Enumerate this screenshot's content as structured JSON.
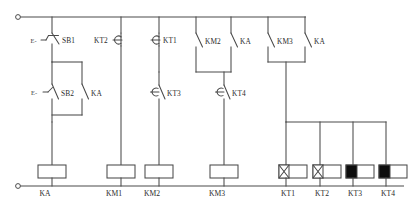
{
  "diagram": {
    "power_rails": {
      "top_label": "top-supply-rail",
      "bottom_label": "bottom-supply-rail"
    },
    "contacts": [
      {
        "id": "sb1",
        "label": "SB1",
        "type": "nc-pushbutton",
        "row": "top"
      },
      {
        "id": "kt2",
        "label": "KT2",
        "type": "nc-timed-contact",
        "row": "top"
      },
      {
        "id": "kt1",
        "label": "KT1",
        "type": "nc-timed-contact",
        "row": "top"
      },
      {
        "id": "km2",
        "label": "KM2",
        "type": "no-contact",
        "row": "top"
      },
      {
        "id": "ka_a",
        "label": "KA",
        "type": "no-contact",
        "row": "top"
      },
      {
        "id": "km3",
        "label": "KM3",
        "type": "no-contact",
        "row": "top"
      },
      {
        "id": "ka_b",
        "label": "KA",
        "type": "no-contact",
        "row": "top"
      },
      {
        "id": "sb2",
        "label": "SB2",
        "type": "no-pushbutton",
        "row": "mid"
      },
      {
        "id": "ka_seal",
        "label": "KA",
        "type": "no-contact",
        "row": "mid"
      },
      {
        "id": "kt3",
        "label": "KT3",
        "type": "no-timed-contact",
        "row": "mid"
      },
      {
        "id": "kt4",
        "label": "KT4",
        "type": "no-timed-contact",
        "row": "mid"
      }
    ],
    "coils": [
      {
        "id": "coil_ka",
        "label": "KA",
        "style": "plain"
      },
      {
        "id": "coil_km1",
        "label": "KM1",
        "style": "plain"
      },
      {
        "id": "coil_km2",
        "label": "KM2",
        "style": "plain"
      },
      {
        "id": "coil_km3",
        "label": "KM3",
        "style": "plain"
      },
      {
        "id": "coil_kt1",
        "label": "KT1",
        "style": "cross"
      },
      {
        "id": "coil_kt2",
        "label": "KT2",
        "style": "cross"
      },
      {
        "id": "coil_kt3",
        "label": "KT3",
        "style": "solid"
      },
      {
        "id": "coil_kt4",
        "label": "KT4",
        "style": "solid"
      }
    ],
    "pushbutton_marks": [
      "E-",
      "E-"
    ],
    "colors": {
      "line": "#4a4a4a",
      "text": "#2b2b2b",
      "fill_block": "#0d0d0d",
      "background": "#ffffff"
    }
  }
}
